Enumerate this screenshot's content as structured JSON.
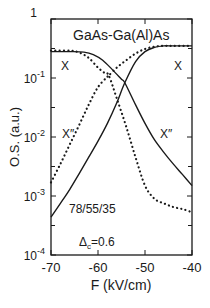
{
  "chart_data": {
    "type": "line",
    "title": "GaAs-Ga(Al)As",
    "xlabel": "F (kV/cm)",
    "ylabel": "O.S. (a.u.)",
    "xlim": [
      -70,
      -40
    ],
    "ylim": [
      0.0001,
      1
    ],
    "yscale": "log",
    "grid": false,
    "x_ticks": [
      "-70",
      "-60",
      "-50",
      "-40"
    ],
    "y_ticks": [
      {
        "base": "1",
        "exp": ""
      },
      {
        "base": "10",
        "exp": "-1"
      },
      {
        "base": "10",
        "exp": "-2"
      },
      {
        "base": "10",
        "exp": "-3"
      },
      {
        "base": "10",
        "exp": "-4"
      }
    ],
    "annotations": [
      {
        "text": "X",
        "x": -67,
        "y": 0.12
      },
      {
        "text": "X",
        "x": -42,
        "y": 0.12
      },
      {
        "text": "X″",
        "x": -67,
        "y": 0.009
      },
      {
        "text": "X″",
        "x": -45,
        "y": 0.009
      },
      {
        "text": "78/55/35",
        "x": -62,
        "y": 0.00045
      },
      {
        "text": "Δc = 0.6",
        "x": -60,
        "y": 0.00016
      }
    ],
    "series": [
      {
        "name": "X (solid, falling)",
        "style": "solid",
        "x": [
          -70,
          -66,
          -63,
          -61,
          -59,
          -57,
          -55,
          -54.3,
          -52,
          -50,
          -48,
          -46,
          -44,
          -42,
          -40
        ],
        "y": [
          0.28,
          0.28,
          0.275,
          0.25,
          0.2,
          0.14,
          0.095,
          0.083,
          0.035,
          0.017,
          0.009,
          0.0055,
          0.0035,
          0.0023,
          0.0015
        ]
      },
      {
        "name": "X (solid, rising)",
        "style": "solid",
        "x": [
          -70,
          -68,
          -66,
          -64,
          -62,
          -60,
          -58,
          -56,
          -54.3,
          -52,
          -50,
          -48,
          -46,
          -44,
          -40
        ],
        "y": [
          0.00044,
          0.00075,
          0.0013,
          0.0024,
          0.0045,
          0.0085,
          0.017,
          0.038,
          0.083,
          0.19,
          0.28,
          0.33,
          0.35,
          0.35,
          0.35
        ]
      },
      {
        "name": "X″ (dotted, falling)",
        "style": "dotted",
        "x": [
          -70,
          -66,
          -64,
          -62,
          -60,
          -58.5,
          -57.7,
          -56,
          -54,
          -52,
          -50,
          -48,
          -46,
          -44,
          -42,
          -40
        ],
        "y": [
          0.29,
          0.29,
          0.27,
          0.22,
          0.15,
          0.12,
          0.11,
          0.045,
          0.015,
          0.0045,
          0.0015,
          0.0009,
          0.00075,
          0.00065,
          0.0006,
          0.00053
        ]
      },
      {
        "name": "X″ (dotted, rising)",
        "style": "dotted",
        "x": [
          -70,
          -68,
          -66,
          -64,
          -62,
          -60,
          -58,
          -57.7,
          -56,
          -54,
          -52,
          -50,
          -48,
          -46,
          -44,
          -40
        ],
        "y": [
          0.0017,
          0.0035,
          0.0075,
          0.016,
          0.035,
          0.07,
          0.105,
          0.11,
          0.15,
          0.2,
          0.26,
          0.31,
          0.34,
          0.35,
          0.35,
          0.35
        ]
      }
    ]
  },
  "labels": {
    "title": "GaAs-Ga(Al)As",
    "xlabel": "F (kV/cm)",
    "ylabel": "O.S. (a.u.)",
    "structure": "78/55/35",
    "delta_prefix": "Δ",
    "delta_sub": "c",
    "delta_value": "=0.6",
    "curve_x_left": "X",
    "curve_x_right": "X",
    "curve_x2_left": "X″",
    "curve_x2_right": "X″"
  }
}
